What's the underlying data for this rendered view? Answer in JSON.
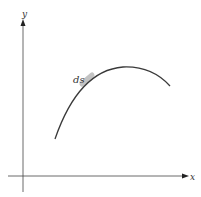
{
  "diagram": {
    "axes": {
      "x_label": "x",
      "y_label": "y"
    },
    "curve": {
      "description": "concave-down arc rising to a maximum then descending",
      "element_label": "ds"
    },
    "colors": {
      "axis": "#444444",
      "curve": "#3a3a3a",
      "highlight": "#b8b8b8",
      "background": "#ffffff"
    }
  }
}
